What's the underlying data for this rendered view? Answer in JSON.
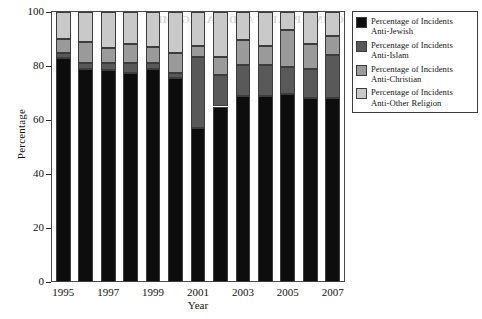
{
  "chart_data": {
    "type": "bar",
    "stacked": true,
    "title": "",
    "xlabel": "Year",
    "ylabel": "Percentage",
    "ylim": [
      0,
      100
    ],
    "yticks": [
      0,
      20,
      40,
      60,
      80,
      100
    ],
    "ytick_labels": [
      "0",
      "20",
      "40",
      "60",
      "80",
      "100"
    ],
    "grid": false,
    "legend_position": "right-top",
    "categories": [
      "1995",
      "1996",
      "1997",
      "1998",
      "1999",
      "2000",
      "2001",
      "2002",
      "2003",
      "2004",
      "2005",
      "2006",
      "2007"
    ],
    "xtick_labels": [
      "1995",
      "1997",
      "1999",
      "2001",
      "2003",
      "2005",
      "2007"
    ],
    "xtick_categories": [
      "1995",
      "1997",
      "1999",
      "2001",
      "2003",
      "2005",
      "2007"
    ],
    "series": [
      {
        "name": "Percentage of Incidents Anti-Jewish",
        "color": "#0d0d0d",
        "values": [
          83,
          79,
          78.5,
          77.5,
          79,
          75.5,
          57,
          65,
          69,
          69,
          69.5,
          68,
          68
        ]
      },
      {
        "name": "Percentage of Incidents Anti-Islam",
        "color": "#595959",
        "values": [
          2,
          2,
          2.5,
          3.5,
          2,
          2,
          26.5,
          11.5,
          11.5,
          11.5,
          10,
          11,
          16
        ]
      },
      {
        "name": "Percentage of Incidents Anti-Christian",
        "color": "#9a9a9a",
        "values": [
          5,
          8,
          5.5,
          7,
          6,
          7.5,
          4,
          7,
          9,
          7,
          14,
          9,
          7
        ]
      },
      {
        "name": "Percentage of Incidents Anti-Other Religion",
        "color": "#c9c9c9",
        "values": [
          10,
          11,
          13.5,
          12,
          13,
          15,
          12.5,
          16.5,
          10.5,
          12.5,
          6.5,
          12,
          9
        ]
      }
    ]
  },
  "legend": {
    "entries": [
      {
        "label": "Percentage of Incidents\nAnti-Jewish",
        "color": "#0d0d0d",
        "swatch_name": "legend-swatch-anti-jewish"
      },
      {
        "label": "Percentage of Incidents\nAnti-Islam",
        "color": "#595959",
        "swatch_name": "legend-swatch-anti-islam"
      },
      {
        "label": "Percentage of Incidents\nAnti-Christian",
        "color": "#9a9a9a",
        "swatch_name": "legend-swatch-anti-christian"
      },
      {
        "label": "Percentage of Incidents\nAnti-Other Religion",
        "color": "#c9c9c9",
        "swatch_name": "legend-swatch-anti-other-religion"
      }
    ]
  },
  "artifact": {
    "bleed_text": "CRIME POLICY AND MANAGEMENT"
  }
}
